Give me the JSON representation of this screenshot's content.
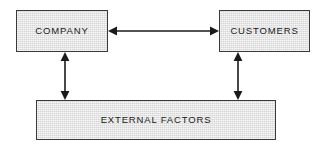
{
  "diagram": {
    "background_color": "#ffffff",
    "node_fill_color": "#d6d6d6",
    "node_border_color": "#3a3a3a",
    "connector_color": "#1b1b1b",
    "text_color": "#1b1b1b",
    "nodes": [
      {
        "id": "company",
        "label": "COMPANY",
        "shape": "rectangle"
      },
      {
        "id": "customers",
        "label": "CUSTOMERS",
        "shape": "rectangle"
      },
      {
        "id": "external_factors",
        "label": "EXTERNAL FACTORS",
        "shape": "rectangle"
      }
    ],
    "connectors": [
      {
        "id": "company-customers",
        "from": "company",
        "to": "customers",
        "style": "double-headed-arrow",
        "orientation": "horizontal"
      },
      {
        "id": "company-external",
        "from": "company",
        "to": "external_factors",
        "style": "double-headed-arrow",
        "orientation": "vertical"
      },
      {
        "id": "customers-external",
        "from": "customers",
        "to": "external_factors",
        "style": "double-headed-arrow",
        "orientation": "vertical"
      }
    ]
  }
}
